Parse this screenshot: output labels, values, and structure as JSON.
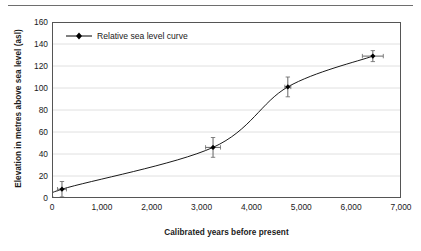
{
  "chart_data": {
    "type": "line",
    "title": "",
    "xlabel": "Calibrated years before present",
    "ylabel": "Elevation in metres above sea level (asl)",
    "xlim": [
      0,
      7000
    ],
    "ylim": [
      0,
      160
    ],
    "xticks": [
      "0",
      "1,000",
      "2,000",
      "3,000",
      "4,000",
      "5,000",
      "6,000",
      "7,000"
    ],
    "xtick_values": [
      0,
      1000,
      2000,
      3000,
      4000,
      5000,
      6000,
      7000
    ],
    "yticks": [
      "0",
      "20",
      "40",
      "60",
      "80",
      "100",
      "120",
      "140",
      "160"
    ],
    "ytick_values": [
      0,
      20,
      40,
      60,
      80,
      100,
      120,
      140,
      160
    ],
    "grid": "horizontal",
    "legend_position": "top-left",
    "series": [
      {
        "name": "Relative sea level curve",
        "marker": "diamond",
        "color": "#000000",
        "x": [
          0,
          200,
          3230,
          4730,
          6435
        ],
        "y": [
          0,
          8,
          46,
          101,
          129
        ],
        "xerr": [
          0,
          90,
          150,
          60,
          210
        ],
        "yerr": [
          0,
          7,
          9,
          9,
          5
        ]
      }
    ]
  },
  "legend": {
    "entries": [
      {
        "label": "Relative sea level curve"
      }
    ]
  },
  "axes": {
    "x_title": "Calibrated years before present",
    "y_title": "Elevation in metres above sea level (asl)"
  }
}
